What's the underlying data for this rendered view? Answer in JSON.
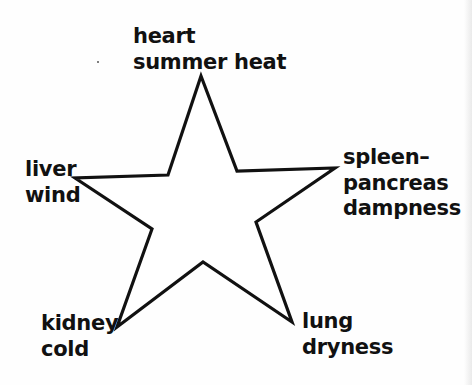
{
  "diagram": {
    "type": "five-pointed-star",
    "stroke_color": "#111111",
    "fill_color": "#ffffff",
    "background_color": "#fefefe",
    "points": {
      "top": {
        "x": 201,
        "y": 76
      },
      "inner_tr": {
        "x": 237,
        "y": 171
      },
      "right": {
        "x": 335,
        "y": 168
      },
      "inner_br": {
        "x": 256,
        "y": 222
      },
      "bottom_right": {
        "x": 292,
        "y": 322
      },
      "inner_bottom": {
        "x": 203,
        "y": 262
      },
      "bottom_left": {
        "x": 117,
        "y": 327
      },
      "inner_bl": {
        "x": 152,
        "y": 229
      },
      "left": {
        "x": 75,
        "y": 178
      },
      "inner_tl": {
        "x": 168,
        "y": 175
      }
    }
  },
  "labels": {
    "top": {
      "lines": [
        "heart",
        "summer heat"
      ]
    },
    "left": {
      "lines": [
        "liver",
        "wind"
      ]
    },
    "right": {
      "lines": [
        "spleen–",
        "pancreas",
        "dampness"
      ]
    },
    "bottom_left": {
      "lines": [
        "kidney",
        "cold"
      ]
    },
    "bottom_right": {
      "lines": [
        "lung",
        "dryness"
      ]
    }
  }
}
